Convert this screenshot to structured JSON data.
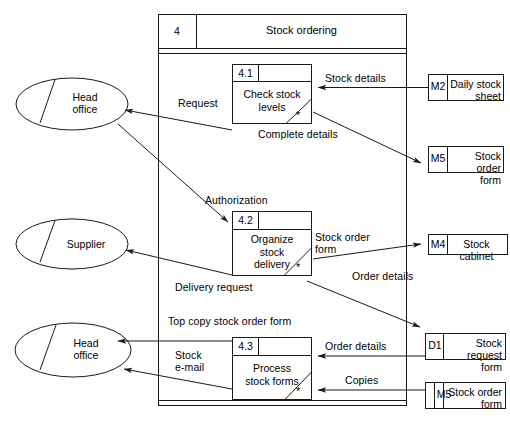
{
  "diagram": {
    "type": "data-flow-diagram",
    "header": {
      "number": "4",
      "title": "Stock ordering"
    },
    "processes": [
      {
        "id": "4.1",
        "number": "4.1",
        "name_line1": "Check stock",
        "name_line2": "levels",
        "name_line3": "",
        "marker": "*"
      },
      {
        "id": "4.2",
        "number": "4.2",
        "name_line1": "Organize",
        "name_line2": "stock",
        "name_line3": "delivery",
        "marker": "*"
      },
      {
        "id": "4.3",
        "number": "4.3",
        "name_line1": "Process",
        "name_line2": "stock forms",
        "name_line3": "",
        "marker": "*"
      }
    ],
    "entities": [
      {
        "id": "head-office-top",
        "line1": "Head",
        "line2": "office"
      },
      {
        "id": "supplier",
        "line1": "Supplier",
        "line2": ""
      },
      {
        "id": "head-office-bottom",
        "line1": "Head",
        "line2": "office"
      }
    ],
    "stores": [
      {
        "id": "M2",
        "code": "M2",
        "line1": "Daily stock",
        "line2": "sheet"
      },
      {
        "id": "M5-top",
        "code": "M5",
        "line1": "Stock order",
        "line2": "form"
      },
      {
        "id": "M4",
        "code": "M4",
        "line1": "Stock cabinet",
        "line2": ""
      },
      {
        "id": "D1",
        "code": "D1",
        "line1": "Stock request",
        "line2": "form"
      },
      {
        "id": "M5-bottom",
        "code": "M5",
        "line1": "Stock order",
        "line2": "form"
      }
    ],
    "flows": [
      {
        "id": "request",
        "label": "Request"
      },
      {
        "id": "stock-details",
        "label": "Stock details"
      },
      {
        "id": "complete-details",
        "label": "Complete details"
      },
      {
        "id": "authorization",
        "label": "Authorization"
      },
      {
        "id": "stock-order-form",
        "label_line1": "Stock order",
        "label_line2": "form"
      },
      {
        "id": "delivery-request",
        "label": "Delivery request"
      },
      {
        "id": "order-details-mid",
        "label": "Order details"
      },
      {
        "id": "top-copy-stock-order-form",
        "label": "Top copy stock order form"
      },
      {
        "id": "stock-email",
        "label_line1": "Stock",
        "label_line2": "e-mail"
      },
      {
        "id": "order-details-bottom",
        "label": "Order details"
      },
      {
        "id": "copies",
        "label": "Copies"
      }
    ],
    "colors": {
      "stroke": "#1a1a1a",
      "text": "#000000",
      "background": "#ffffff"
    }
  }
}
